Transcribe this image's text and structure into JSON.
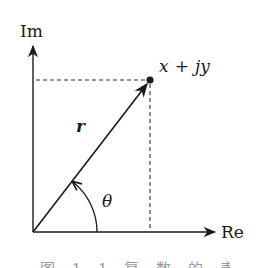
{
  "diagram": {
    "type": "complex-plane-polar-representation",
    "axes": {
      "imaginary_label": "Im",
      "real_label": "Re"
    },
    "point": {
      "label": "x + jy",
      "label_parts": {
        "x": "x",
        "plus": "+",
        "jy": "jy"
      }
    },
    "vector": {
      "label": "r"
    },
    "angle": {
      "label": "θ"
    },
    "caption": "图 1.1  复 数 的 表 示",
    "colors": {
      "stroke": "#1a1a1a",
      "dashed": "#333333",
      "background": "#ffffff"
    }
  }
}
